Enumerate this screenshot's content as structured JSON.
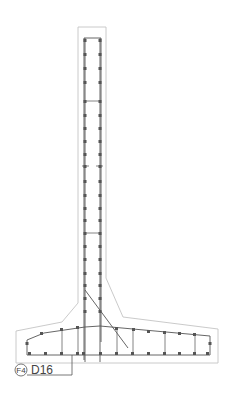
{
  "drawing": {
    "title": "Cantilever retaining wall rebar cross-section",
    "callout": {
      "mark": "F4",
      "label": "D16"
    },
    "colors": {
      "concrete_outline": "#c4c4c4",
      "rebar": "#555555",
      "background": "#ffffff"
    }
  }
}
